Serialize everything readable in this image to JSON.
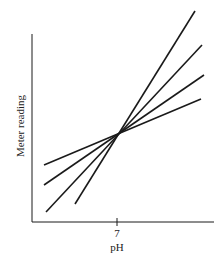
{
  "chart_data": {
    "type": "line",
    "title": "",
    "xlabel": "pH",
    "ylabel": "Meter reading",
    "x_ticks": [
      "7"
    ],
    "grid": false,
    "legend": null,
    "annotations": [],
    "series": [
      {
        "name": "line-1 (steepest)",
        "points_px": [
          [
            75,
            204
          ],
          [
            195,
            11
          ]
        ]
      },
      {
        "name": "line-2",
        "points_px": [
          [
            46,
            212
          ],
          [
            202,
            45
          ]
        ]
      },
      {
        "name": "line-3",
        "points_px": [
          [
            44,
            185
          ],
          [
            204,
            75
          ]
        ]
      },
      {
        "name": "line-4 (shallowest)",
        "points_px": [
          [
            44,
            165
          ],
          [
            201,
            99
          ]
        ]
      }
    ],
    "intersection_px": [
      115,
      134
    ],
    "axes_px": {
      "origin": [
        32,
        222
      ],
      "y_top": 34,
      "x_right": 214,
      "tick_x": 117
    }
  }
}
